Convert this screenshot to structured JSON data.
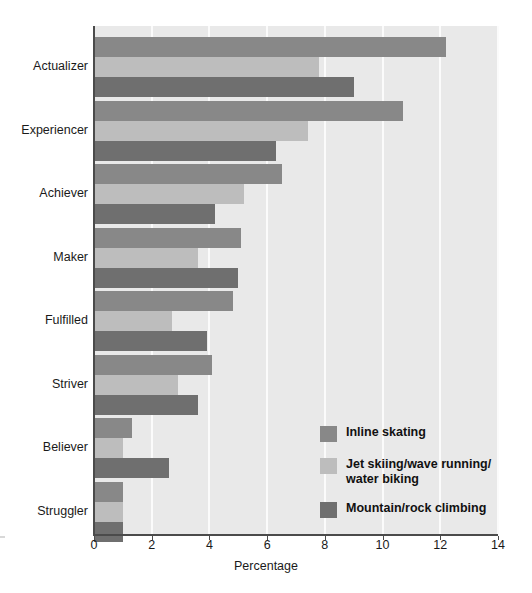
{
  "chart_data": {
    "type": "bar",
    "orientation": "horizontal",
    "title": "",
    "xlabel": "Percentage",
    "ylabel": "",
    "xlim": [
      0,
      14
    ],
    "xticks": [
      0,
      2,
      4,
      6,
      8,
      10,
      12,
      14
    ],
    "grid": "vertical-white-gridlines",
    "legend_position": "inside-lower-right",
    "categories": [
      "Actualizer",
      "Experiencer",
      "Achiever",
      "Maker",
      "Fulfilled",
      "Striver",
      "Believer",
      "Struggler"
    ],
    "series": [
      {
        "name": "Inline skating",
        "color": "#888888",
        "values": [
          12.2,
          10.7,
          6.5,
          5.1,
          4.8,
          4.1,
          1.3,
          1.0
        ]
      },
      {
        "name": "Jet skiing/wave running/\nwater biking",
        "color": "#bdbdbd",
        "values": [
          7.8,
          7.4,
          5.2,
          3.6,
          2.7,
          2.9,
          1.0,
          1.0
        ]
      },
      {
        "name": "Mountain/rock climbing",
        "color": "#6f6f6f",
        "values": [
          9.0,
          6.3,
          4.2,
          5.0,
          3.9,
          3.6,
          2.6,
          1.0
        ]
      }
    ]
  }
}
